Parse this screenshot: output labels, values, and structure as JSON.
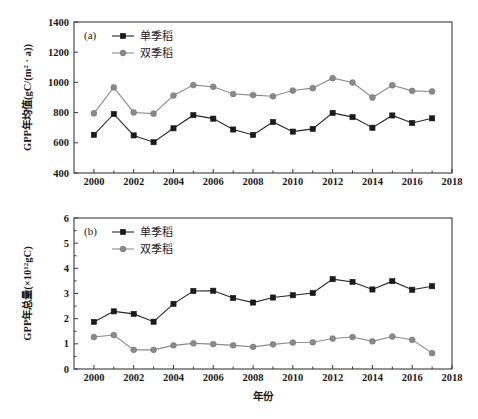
{
  "figure": {
    "background_color": "#ffffff",
    "series_colors": {
      "single_season": "#1a1a1a",
      "double_season": "#8a8a8a"
    }
  },
  "panel_a": {
    "panel_label": "(a)",
    "legend": [
      {
        "label": "单季稻",
        "marker": "square-marker",
        "color": "#1a1a1a"
      },
      {
        "label": "双季稻",
        "marker": "circle-marker",
        "color": "#8a8a8a"
      }
    ],
    "ylabel_main": "GPP年均值(gC/(m",
    "ylabel_sup": "2",
    "ylabel_tail": " · a))",
    "ylabel_full": "GPP年均值(gC/(m² · a))",
    "ytick_labels": [
      "400",
      "600",
      "800",
      "1000",
      "1200",
      "1400"
    ],
    "xtick_labels": [
      "2000",
      "2002",
      "2004",
      "2006",
      "2008",
      "2010",
      "2012",
      "2014",
      "2016",
      "2018"
    ]
  },
  "panel_b": {
    "panel_label": "(b)",
    "legend": [
      {
        "label": "单季稻",
        "marker": "square-marker",
        "color": "#1a1a1a"
      },
      {
        "label": "双季稻",
        "marker": "circle-marker",
        "color": "#8a8a8a"
      }
    ],
    "ylabel_main": "GPP年总量(×10",
    "ylabel_sup": "12",
    "ylabel_tail": "gC)",
    "ylabel_full": "GPP年总量(×10¹²gC)",
    "xlabel": "年份",
    "ytick_labels": [
      "0",
      "1",
      "2",
      "3",
      "4",
      "5",
      "6"
    ],
    "xtick_labels": [
      "2000",
      "2002",
      "2004",
      "2006",
      "2008",
      "2010",
      "2012",
      "2014",
      "2016",
      "2018"
    ]
  },
  "chart_data": [
    {
      "type": "line",
      "panel": "(a)",
      "title": "",
      "xlabel": "",
      "ylabel": "GPP年均值(gC/(m² · a))",
      "xlim": [
        1999,
        2018
      ],
      "ylim": [
        400,
        1400
      ],
      "xticks": [
        2000,
        2002,
        2004,
        2006,
        2008,
        2010,
        2012,
        2014,
        2016,
        2018
      ],
      "yticks": [
        400,
        600,
        800,
        1000,
        1200,
        1400
      ],
      "grid": false,
      "legend_position": "top-center",
      "x": [
        2000,
        2001,
        2002,
        2003,
        2004,
        2005,
        2006,
        2007,
        2008,
        2009,
        2010,
        2011,
        2012,
        2013,
        2014,
        2015,
        2016,
        2017
      ],
      "series": [
        {
          "name": "单季稻",
          "marker": "square",
          "color": "#1a1a1a",
          "values": [
            653,
            791,
            649,
            604,
            696,
            783,
            760,
            688,
            652,
            738,
            674,
            692,
            798,
            770,
            700,
            781,
            731,
            762
          ]
        },
        {
          "name": "双季稻",
          "marker": "circle",
          "color": "#8a8a8a",
          "values": [
            795,
            967,
            801,
            793,
            913,
            982,
            971,
            923,
            916,
            908,
            946,
            962,
            1028,
            999,
            900,
            981,
            944,
            940
          ]
        }
      ]
    },
    {
      "type": "line",
      "panel": "(b)",
      "title": "",
      "xlabel": "年份",
      "ylabel": "GPP年总量(×10¹²gC)",
      "xlim": [
        1999,
        2018
      ],
      "ylim": [
        0,
        6
      ],
      "xticks": [
        2000,
        2002,
        2004,
        2006,
        2008,
        2010,
        2012,
        2014,
        2016,
        2018
      ],
      "yticks": [
        0,
        1,
        2,
        3,
        4,
        5,
        6
      ],
      "grid": false,
      "legend_position": "top-center",
      "x": [
        2000,
        2001,
        2002,
        2003,
        2004,
        2005,
        2006,
        2007,
        2008,
        2009,
        2010,
        2011,
        2012,
        2013,
        2014,
        2015,
        2016,
        2017
      ],
      "series": [
        {
          "name": "单季稻",
          "marker": "square",
          "color": "#1a1a1a",
          "values": [
            1.87,
            2.29,
            2.19,
            1.88,
            2.59,
            3.1,
            3.11,
            2.82,
            2.64,
            2.84,
            2.93,
            3.02,
            3.57,
            3.46,
            3.16,
            3.49,
            3.15,
            3.29
          ]
        },
        {
          "name": "双季稻",
          "marker": "circle",
          "color": "#8a8a8a",
          "values": [
            1.27,
            1.35,
            0.76,
            0.76,
            0.94,
            1.02,
            0.99,
            0.94,
            0.88,
            0.98,
            1.05,
            1.06,
            1.21,
            1.27,
            1.1,
            1.29,
            1.16,
            0.63
          ]
        }
      ]
    }
  ]
}
